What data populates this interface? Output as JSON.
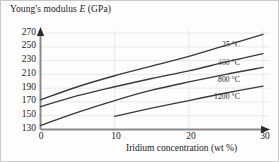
{
  "chart_data": {
    "type": "line",
    "title": "Young's modulus E (GPa)",
    "title_plain": "Young's modulus",
    "title_symbol": "E",
    "title_units": "(GPa)",
    "xlabel": "Iridium concentration (wt %)",
    "ylabel": "Young's modulus E (GPa)",
    "xlim": [
      0,
      30
    ],
    "ylim": [
      130,
      275
    ],
    "xticks": [
      0,
      10,
      20,
      30
    ],
    "yticks": [
      130,
      150,
      170,
      190,
      210,
      230,
      250,
      270
    ],
    "xtick_labels": [
      "0",
      "10",
      "20",
      "30"
    ],
    "ytick_labels": [
      "130",
      "150",
      "170",
      "190",
      "210",
      "230",
      "250",
      "270"
    ],
    "grid": true,
    "legend_position": "inline-right-of-curves",
    "series": [
      {
        "name": "25 °C",
        "label": "25 °C",
        "color": "#3a3a3a",
        "x": [
          0,
          5,
          10,
          15,
          20,
          25,
          30
        ],
        "values": [
          173,
          192,
          208,
          222,
          236,
          252,
          268
        ]
      },
      {
        "name": "400 °C",
        "label": "400 °C",
        "color": "#3a3a3a",
        "x": [
          0,
          5,
          10,
          15,
          20,
          25,
          30
        ],
        "values": [
          163,
          179,
          192,
          204,
          215,
          228,
          240
        ]
      },
      {
        "name": "800 °C",
        "label": "800 °C",
        "color": "#3a3a3a",
        "x": [
          0,
          5,
          10,
          15,
          20,
          25,
          30
        ],
        "values": [
          136,
          155,
          172,
          187,
          199,
          210,
          220
        ]
      },
      {
        "name": "1200 °C",
        "label": "1200 °C",
        "color": "#3a3a3a",
        "x": [
          10,
          15,
          20,
          25,
          30
        ],
        "values": [
          149,
          161,
          172,
          183,
          193
        ]
      }
    ]
  }
}
